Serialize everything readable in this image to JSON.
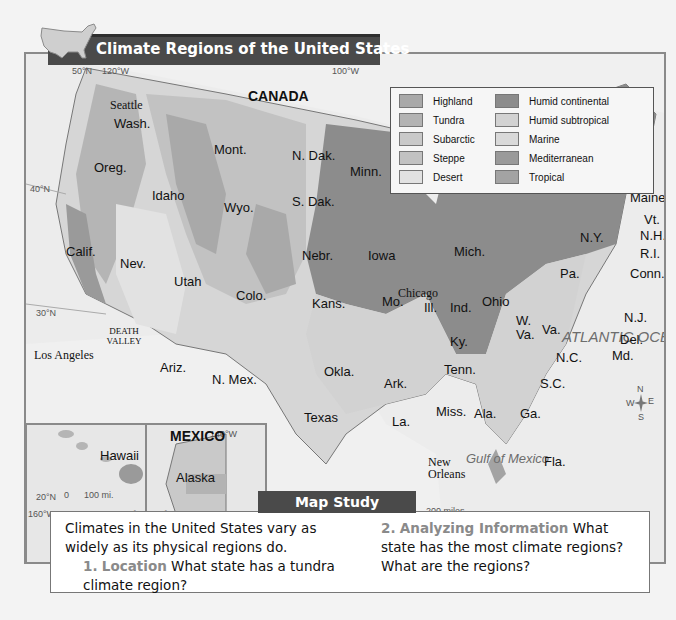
{
  "figure": {
    "title": "Climate Regions of the United States"
  },
  "legend": {
    "items": [
      {
        "label": "Highland",
        "color": "#a9a9a9"
      },
      {
        "label": "Tundra",
        "color": "#b3b3b3"
      },
      {
        "label": "Subarctic",
        "color": "#c9c9c9"
      },
      {
        "label": "Steppe",
        "color": "#c2c2c2"
      },
      {
        "label": "Desert",
        "color": "#e2e2e2"
      },
      {
        "label": "Humid continental",
        "color": "#8c8c8c"
      },
      {
        "label": "Humid subtropical",
        "color": "#d2d2d2"
      },
      {
        "label": "Marine",
        "color": "#d9d9d9"
      },
      {
        "label": "Mediterranean",
        "color": "#9a9a9a"
      },
      {
        "label": "Tropical",
        "color": "#a3a3a3"
      }
    ]
  },
  "map": {
    "countries": {
      "canada": "CANADA",
      "mexico": "MEXICO"
    },
    "water": {
      "atlantic": "ATLANTIC OCEAN",
      "gulf": "Gulf of Mexico",
      "ontario": "L. Ontario",
      "michigan": "L. Michigan",
      "huron": "Huron",
      "erie": "L. Erie"
    },
    "coords": {
      "lat50": "50°N",
      "lon120": "120°W",
      "lon100": "100°W",
      "lat40": "40°N",
      "lat30": "30°N",
      "lat20": "20°N",
      "lon160": "160°W",
      "lon155": "155°W",
      "lon140": "140°W",
      "lat60": "60°N"
    },
    "cities": {
      "seattle": "Seattle",
      "los_angeles": "Los Angeles",
      "chicago": "Chicago",
      "new_orleans": "New Orleans",
      "death_valley": "DEATH VALLEY"
    },
    "states": {
      "wash": "Wash.",
      "oreg": "Oreg.",
      "calif": "Calif.",
      "nev": "Nev.",
      "idaho": "Idaho",
      "mont": "Mont.",
      "wyo": "Wyo.",
      "utah": "Utah",
      "colo": "Colo.",
      "ariz": "Ariz.",
      "nmex": "N. Mex.",
      "ndak": "N. Dak.",
      "sdak": "S. Dak.",
      "nebr": "Nebr.",
      "kans": "Kans.",
      "okla": "Okla.",
      "texas": "Texas",
      "minn": "Minn.",
      "iowa": "Iowa",
      "mo": "Mo.",
      "ark": "Ark.",
      "la": "La.",
      "wis": "Wis.",
      "ill": "Ill.",
      "mich": "Mich.",
      "ind": "Ind.",
      "ohio": "Ohio",
      "ky": "Ky.",
      "tenn": "Tenn.",
      "miss": "Miss.",
      "ala": "Ala.",
      "ga": "Ga.",
      "fla": "Fla.",
      "sc": "S.C.",
      "nc": "N.C.",
      "va": "Va.",
      "wva": "W. Va.",
      "pa": "Pa.",
      "ny": "N.Y.",
      "nj": "N.J.",
      "del": "Del.",
      "md": "Md.",
      "conn": "Conn.",
      "ri": "R.I.",
      "nh": "N.H.",
      "vt": "Vt.",
      "maine": "Maine",
      "hawaii": "Hawaii",
      "alaska": "Alaska"
    },
    "scale_main": {
      "zero_top": "0",
      "miles": "200 miles",
      "zero_bottom": "0",
      "km": "200 kilometers",
      "projection": "Lambert Equal-Area projection"
    },
    "scale_hawaii": {
      "zero_top": "0",
      "miles": "100 mi.",
      "zero_bottom": "0",
      "km": "100 km"
    },
    "scale_alaska": {
      "zero_top": "0",
      "miles": "250 mi.",
      "km": "0 250 km"
    },
    "compass": {
      "n": "N",
      "s": "S",
      "e": "E",
      "w": "W"
    }
  },
  "map_study": {
    "tab_label": "Map Study",
    "intro": "Climates in the United States vary as widely as its physical regions do.",
    "questions": [
      {
        "num": "1.",
        "skill": "Location",
        "text": "What state has a tundra climate region?"
      },
      {
        "num": "2.",
        "skill": "Analyzing Information",
        "text": "What state has the most climate regions? What are the regions?"
      }
    ]
  }
}
